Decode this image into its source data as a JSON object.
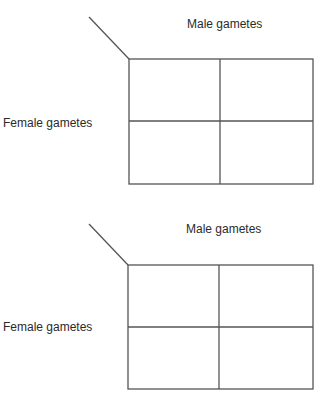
{
  "diagrams": [
    {
      "name": "punnett-square-1",
      "male_label": "Male gametes",
      "female_label": "Female gametes",
      "rows": 2,
      "cols": 2,
      "cells": [
        [
          "",
          ""
        ],
        [
          "",
          ""
        ]
      ]
    },
    {
      "name": "punnett-square-2",
      "male_label": "Male gametes",
      "female_label": "Female gametes",
      "rows": 2,
      "cols": 2,
      "cells": [
        [
          "",
          ""
        ],
        [
          "",
          ""
        ]
      ]
    }
  ],
  "colors": {
    "line": "#555555",
    "text": "#2a2a2a",
    "background": "#ffffff"
  }
}
